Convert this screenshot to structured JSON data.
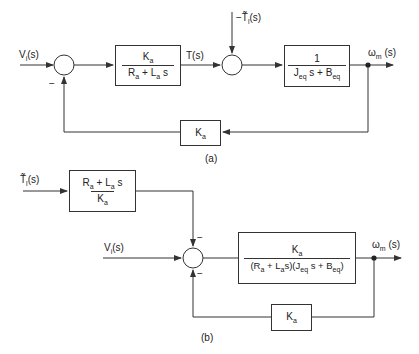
{
  "diagram_a": {
    "caption": "(a)",
    "input_label": "V_i(s)",
    "input_text": "V",
    "input_sub": "i",
    "input_suffix": "(s)",
    "sum1_sign_feedback": "−",
    "block1": {
      "numerator": "K_a",
      "num_main": "K",
      "num_sub": "a",
      "denominator": "R_a + L_a s",
      "den_r": "R",
      "den_r_sub": "a",
      "den_mid": " + L",
      "den_l_sub": "a",
      "den_s": "s"
    },
    "torque_label": "T(s)",
    "disturbance_label": "−T̃_l(s)",
    "dist_prefix": "−",
    "dist_main": "T̃",
    "dist_sub": "l",
    "dist_suffix": "(s)",
    "block2": {
      "numerator": "1",
      "denominator": "J_eq s + B_eq",
      "den_j": "J",
      "den_j_sub": "eq",
      "den_mid": "s + B",
      "den_b_sub": "eq"
    },
    "output_label": "ω_m(s)",
    "out_main": "ω",
    "out_sub": "m",
    "out_suffix": "(s)",
    "feedback_block": {
      "label": "K_a",
      "main": "K",
      "sub": "a"
    }
  },
  "diagram_b": {
    "caption": "(b)",
    "disturbance_label": "T̃_l(s)",
    "dist_main": "T̃",
    "dist_sub": "l",
    "dist_suffix": "(s)",
    "dist_block": {
      "numerator": "R_a + L_a s",
      "num_r": "R",
      "num_r_sub": "a",
      "num_mid": " + L",
      "num_l_sub": "a",
      "num_s": "s",
      "denominator": "K_a",
      "den_main": "K",
      "den_sub": "a"
    },
    "input_label": "V_i(s)",
    "input_text": "V",
    "input_sub": "i",
    "input_suffix": "(s)",
    "sum_sign_top": "−",
    "sum_sign_bottom": "−",
    "forward_block": {
      "numerator": "K_a",
      "num_main": "K",
      "num_sub": "a",
      "denominator": "(R_a + L_a s)(J_eq s + B_eq)",
      "d1": "(R",
      "d1_sub": "a",
      "d2": " + L",
      "d2_sub": "a",
      "d3": "s)(J",
      "d3_sub": "eq",
      "d4": "s + B",
      "d4_sub": "eq",
      "d5": ")"
    },
    "output_label": "ω_m(s)",
    "out_main": "ω",
    "out_sub": "m",
    "out_suffix": "(s)",
    "feedback_block": {
      "label": "K_a",
      "main": "K",
      "sub": "a"
    }
  },
  "colors": {
    "line": "#333333",
    "text": "#222222",
    "background": "#ffffff"
  }
}
